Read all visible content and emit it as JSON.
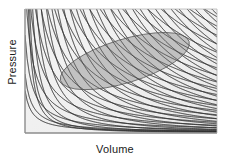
{
  "figure": {
    "type": "pv-diagram",
    "background_color": "#ffffff",
    "plot_area": {
      "x": 25,
      "y": 9,
      "width": 192,
      "height": 124
    },
    "frame_color": "#8c8c8c",
    "plot_background": "#f2f2f2"
  },
  "axes": {
    "x_label": "Volume",
    "y_label": "Pressure",
    "label_color": "#1a1a1a",
    "show_ticks": false,
    "show_tick_labels": false
  },
  "chart_data": {
    "type": "line",
    "title": "",
    "xlabel": "Volume",
    "ylabel": "Pressure",
    "xlim": [
      0,
      1
    ],
    "ylim": [
      0,
      1
    ],
    "grid": false,
    "legend": "none",
    "curve_color": "#3a3a3a",
    "curve_width": 0.7,
    "series": [
      {
        "name": "isotherms",
        "description": "Family of hyperbola-like curves decreasing from upper-left to lower-right",
        "count": 26,
        "shape": "hyperbolic",
        "color": "#3a3a3a"
      },
      {
        "name": "adiabats",
        "description": "Second family of steeper curves crossing the isotherms, forming a mesh",
        "count": 30,
        "shape": "steep-hyperbolic",
        "color": "#3a3a3a"
      }
    ],
    "annotations": [
      {
        "name": "cycle-region",
        "shape": "ellipse",
        "center": [
          0.52,
          0.58
        ],
        "rx": 0.35,
        "ry": 0.175,
        "rotation_deg": -17,
        "fill": "#9a9a9a",
        "fill_opacity": 0.55,
        "stroke": "#6d6d6d"
      }
    ]
  }
}
